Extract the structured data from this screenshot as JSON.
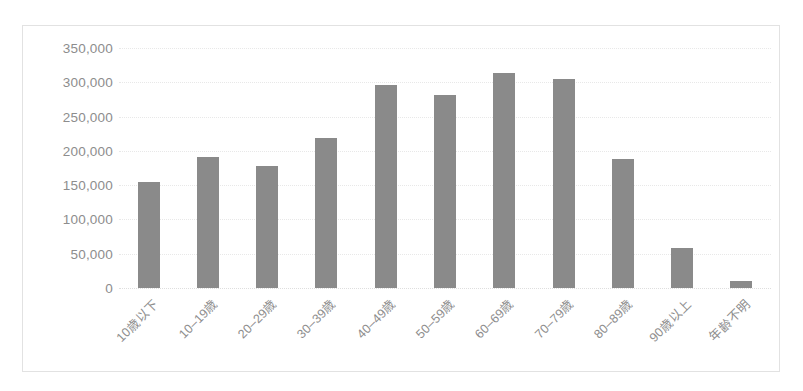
{
  "chart_data": {
    "type": "bar",
    "title": "",
    "xlabel": "",
    "ylabel": "",
    "categories": [
      "10歳以下",
      "10–19歳",
      "20–29歳",
      "30–39歳",
      "40–49歳",
      "50–59歳",
      "60–69歳",
      "70–79歳",
      "80–89歳",
      "90歳以上",
      "年齢不明"
    ],
    "values": [
      155000,
      191000,
      178000,
      219000,
      296000,
      281000,
      313000,
      305000,
      188000,
      59000,
      10000
    ],
    "ylim": [
      0,
      350000
    ],
    "yticks": [
      0,
      50000,
      100000,
      150000,
      200000,
      250000,
      300000,
      350000
    ],
    "ytick_labels": [
      "0",
      "50,000",
      "100,000",
      "150,000",
      "200,000",
      "250,000",
      "300,000",
      "350,000"
    ],
    "grid": true,
    "legend": "none",
    "bar_color": "#8a8a8a",
    "gridline_color": "#e8e8e8",
    "axis_text_color": "#8d8d8d",
    "frame_border_color": "#e2e2e2",
    "background_color": "#ffffff"
  }
}
